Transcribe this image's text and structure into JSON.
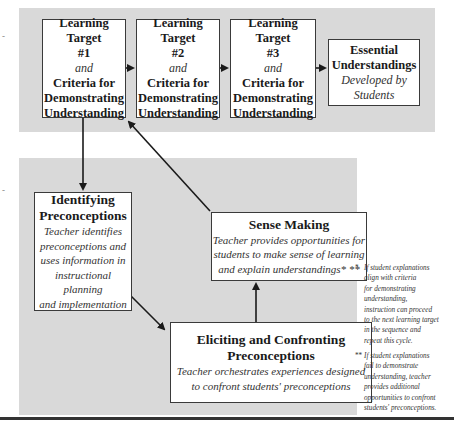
{
  "top_row": {
    "targets": [
      {
        "title": "Learning Target",
        "number": "#1",
        "connector": "and",
        "criteria_line1": "Criteria for",
        "criteria_line2": "Demonstrating",
        "criteria_line3": "Understanding"
      },
      {
        "title": "Learning Target",
        "number": "#2",
        "connector": "and",
        "criteria_line1": "Criteria for",
        "criteria_line2": "Demonstrating",
        "criteria_line3": "Understanding"
      },
      {
        "title": "Learning Target",
        "number": "#3",
        "connector": "and",
        "criteria_line1": "Criteria for",
        "criteria_line2": "Demonstrating",
        "criteria_line3": "Understanding"
      }
    ],
    "essential": {
      "title_line1": "Essential",
      "title_line2": "Understandings",
      "sub_line1": "Developed by",
      "sub_line2": "Students"
    }
  },
  "cycle": {
    "identifying": {
      "title_line1": "Identifying",
      "title_line2": "Preconceptions",
      "desc": [
        "Teacher identifies",
        "preconceptions and",
        "uses information in",
        "instructional planning",
        "and implementation"
      ]
    },
    "sense_making": {
      "title": "Sense Making",
      "desc": [
        "Teacher provides opportunities for",
        "students to make sense of learning",
        "and explain understandings*  **"
      ]
    },
    "eliciting": {
      "title_line1": "Eliciting and Confronting",
      "title_line2": "Preconceptions",
      "desc": [
        "Teacher orchestrates experiences designed",
        "to confront students' preconceptions"
      ]
    }
  },
  "notes": [
    {
      "mark": "*",
      "lines": [
        "If student explanations",
        "align with criteria",
        "for demonstrating",
        "understanding,",
        "instruction can proceed",
        "to the next learning target",
        "in the sequence and",
        "repeat this cycle."
      ]
    },
    {
      "mark": "**",
      "lines": [
        "If student explanations",
        "fail to demonstrate",
        "understanding, teacher",
        "provides additional",
        "opportunities to  confront",
        "students' preconceptions."
      ]
    }
  ],
  "margin_ticks": [
    "-",
    "-"
  ],
  "colors": {
    "panel": "#d9d9d9",
    "box_border": "#3a3a3a",
    "arrow": "#1a1a1a"
  }
}
